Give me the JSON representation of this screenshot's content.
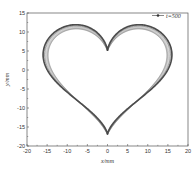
{
  "chart_data": {
    "type": "line",
    "title": "",
    "xlabel": "x/mm",
    "ylabel": "y/mm",
    "xlim": [
      -20,
      20
    ],
    "ylim": [
      -20,
      15
    ],
    "xticks": [
      -20,
      -15,
      -10,
      -5,
      0,
      5,
      10,
      15,
      20
    ],
    "yticks": [
      -20,
      -15,
      -10,
      -5,
      0,
      5,
      10,
      15
    ],
    "grid": false,
    "legend": {
      "position": "upper right",
      "entries": [
        "t=500"
      ]
    },
    "series": [
      {
        "name": "t=500",
        "description": "Heart curve x=16sin^3(t), y=13cos(t)-5cos(2t)-2cos(3t)-cos(4t), sampled with 500 points, drawn with chord lines between successive samples creating string-art shading",
        "points": 500,
        "x_range": [
          -16,
          16
        ],
        "y_range": [
          -17,
          12
        ],
        "notch_point": [
          0,
          5
        ],
        "bottom_point": [
          0,
          -17
        ],
        "color": "#555555"
      }
    ]
  },
  "axes": {
    "xlabel": "x/mm",
    "ylabel": "y/mm",
    "xtick_labels": [
      "-20",
      "-15",
      "-10",
      "-5",
      "0",
      "5",
      "10",
      "15",
      "20"
    ],
    "ytick_labels": [
      "-20",
      "-15",
      "-10",
      "-5",
      "0",
      "5",
      "10",
      "15"
    ]
  },
  "legend": {
    "label": "t=500"
  }
}
